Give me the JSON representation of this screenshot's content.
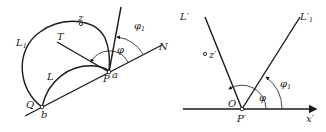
{
  "left_figure": {
    "labels": {
      "L1": "L",
      "L1_sub": "1",
      "L": "L",
      "z": "z",
      "T": "T",
      "N": "N",
      "phi": "φ",
      "phi1": "φ",
      "phi1_sub": "1",
      "P": "P",
      "a": "a",
      "Q": "Q",
      "b": "b"
    }
  },
  "right_figure": {
    "labels": {
      "L_prime": "L′",
      "L1_prime": "L′",
      "L1_prime_sub": "1",
      "z_prime": "z′",
      "O": "O",
      "P_prime": "P′",
      "phi": "φ",
      "phi1": "φ",
      "phi1_sub": "1",
      "x_prime": "x′"
    }
  }
}
